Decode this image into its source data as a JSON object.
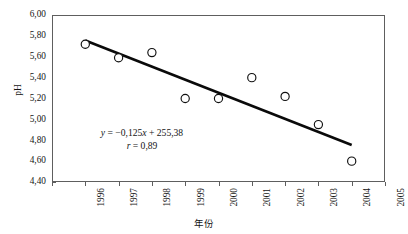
{
  "chart_data": {
    "type": "scatter",
    "title": "",
    "subtitle": "",
    "xlabel": "年份",
    "ylabel": "pH",
    "x": [
      1997,
      1998,
      1999,
      2000,
      2001,
      2002,
      2003,
      2004,
      2005
    ],
    "values": [
      5.72,
      5.59,
      5.64,
      5.2,
      5.2,
      5.4,
      5.22,
      4.95,
      4.6
    ],
    "series": [
      {
        "name": "pH",
        "marker": "open-circle",
        "x": [
          1997,
          1998,
          1999,
          2000,
          2001,
          2002,
          2003,
          2004,
          2005
        ],
        "values": [
          5.72,
          5.59,
          5.64,
          5.2,
          5.2,
          5.4,
          5.22,
          4.95,
          4.6
        ]
      },
      {
        "name": "trendline",
        "type": "line",
        "x": [
          1997,
          2005
        ],
        "values": [
          5.755,
          5.745
        ]
      }
    ],
    "trendline": {
      "slope": -0.125,
      "intercept": 255.38,
      "x_start": 1997,
      "x_end": 2005,
      "y_start": 5.755,
      "y_end": 4.755
    },
    "xlim": [
      1996,
      2006
    ],
    "ylim": [
      4.4,
      6.0
    ],
    "xticks": [
      1996,
      1997,
      1998,
      1999,
      2000,
      2001,
      2002,
      2003,
      2004,
      2005,
      2006
    ],
    "yticks": [
      4.4,
      4.6,
      4.8,
      5.0,
      5.2,
      5.4,
      5.6,
      5.8,
      6.0
    ],
    "xtick_labels": [
      "1996",
      "1997",
      "1998",
      "1999",
      "2000",
      "2001",
      "2002",
      "2003",
      "2004",
      "2005",
      "2006"
    ],
    "ytick_labels": [
      "4,40",
      "4,60",
      "4,80",
      "5,00",
      "5,20",
      "5,40",
      "5,60",
      "5,80",
      "6,00"
    ],
    "grid": false,
    "legend": null,
    "annotations": [
      {
        "text": "y = -0,125x + 255,38",
        "line": 1
      },
      {
        "text": "r = 0,89",
        "line": 2
      }
    ],
    "colors": {
      "marker_fill": "#ffffff",
      "marker_stroke": "#101010",
      "trendline": "#0a0a0a",
      "frame": "#5e5e5e",
      "text": "#141414",
      "background": "#ffffff"
    }
  },
  "equation": {
    "y_symbol": "y",
    "equals": " = ",
    "slope_term": "−0,125",
    "x_symbol": "x",
    "plus": " + ",
    "intercept": "255,38",
    "r_symbol": "r",
    "r_equals": " = ",
    "r_value": "0,89"
  }
}
